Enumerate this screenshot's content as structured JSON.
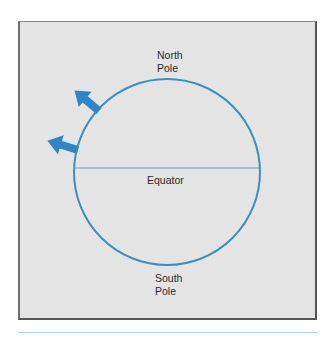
{
  "figure": {
    "labels": {
      "north_line1": "North",
      "north_line2": "Pole",
      "equator": "Equator",
      "south_line1": "South",
      "south_line2": "Pole"
    },
    "colors": {
      "panel_bg": "#e3e4e3",
      "circle_stroke": "#3b8fc0",
      "arrow_fill": "#2f86c6",
      "equator_line": "#6a9fbf",
      "bottom_rule": "#a9dbe8",
      "text": "#2a2a2a"
    },
    "icons": [
      "upper-arrow-icon",
      "lower-arrow-icon"
    ]
  }
}
